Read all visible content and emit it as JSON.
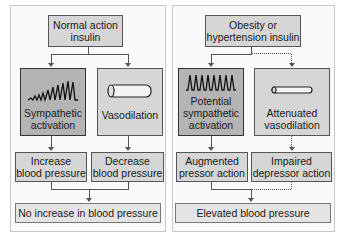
{
  "left": {
    "top": "Normal action insulin",
    "top_lines": [
      "Normal action",
      "insulin"
    ],
    "mid_left": {
      "lines": [
        "Sympathetic",
        "activation"
      ],
      "icon": "spike-waveform-increasing-icon"
    },
    "mid_right": {
      "lines": [
        "Vasodilation"
      ],
      "icon": "dilated-vessel-icon"
    },
    "effect_left": [
      "Increase",
      "blood pressure"
    ],
    "effect_right": [
      "Decrease",
      "blood pressure"
    ],
    "result": "No increase in blood pressure"
  },
  "right": {
    "top_lines": [
      "Obesity or",
      "hypertension insulin"
    ],
    "mid_left": {
      "lines": [
        "Potential",
        "sympathetic",
        "activation"
      ],
      "icon": "spike-waveform-uniform-icon"
    },
    "mid_right": {
      "lines": [
        "Attenuated",
        "vasodilation"
      ],
      "icon": "narrow-vessel-icon"
    },
    "effect_left": [
      "Augmented",
      "pressor action"
    ],
    "effect_right": [
      "Impaired",
      "depressor action"
    ],
    "result": "Elevated blood pressure"
  },
  "colors": {
    "box_fill": "#d6d6d6",
    "dark_fill": "#b4b4b4",
    "border": "#555555",
    "panel_bg": "#fafafa"
  }
}
